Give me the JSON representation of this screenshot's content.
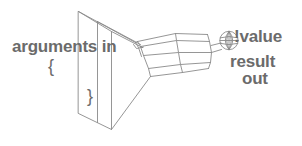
{
  "diagram": {
    "stroke_color": "#8a8a8a",
    "text_color": "#6b6b6b",
    "background": "#ffffff",
    "labels": {
      "arguments_in": "arguments in",
      "brace_open": "{",
      "brace_close": "}",
      "bang_value": "!value",
      "result": "result",
      "out": "out"
    },
    "shapes": {
      "funnel": "open rectangular funnel mouth tapering right",
      "barrel": "faceted cylinder body with three segments",
      "ball": "small wireframe globe at the right tip"
    }
  }
}
